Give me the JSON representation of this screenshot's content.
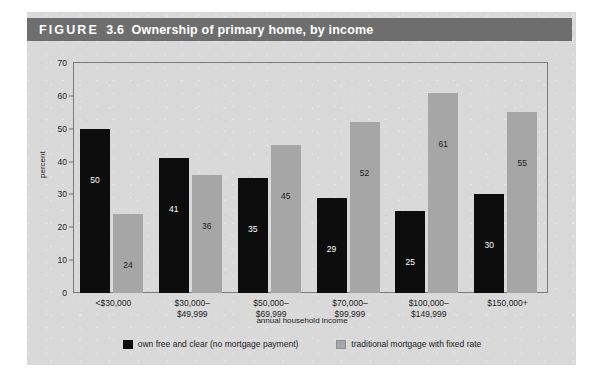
{
  "figure": {
    "label": "FIGURE",
    "number": "3.6",
    "title": "Ownership of primary home, by income"
  },
  "colors": {
    "header_bar": "#6e6e6e",
    "panel_background": "#d9d9d9",
    "series_own_free_and_clear": "#0d0d0d",
    "series_traditional_mortgage": "#a6a6a6",
    "axis": "#7a7a7a"
  },
  "chart_data": {
    "type": "bar",
    "title": "Ownership of primary home, by income",
    "xlabel": "annual household income",
    "ylabel": "percent",
    "ylim": [
      0,
      70
    ],
    "yticks": [
      0,
      10,
      20,
      30,
      40,
      50,
      60,
      70
    ],
    "grid": false,
    "legend_position": "bottom",
    "categories": [
      "<$30,000",
      "$30,000–\n$49,999",
      "$50,000–\n$69,999",
      "$70,000–\n$99,999",
      "$100,000–\n$149,999",
      "$150,000+"
    ],
    "series": [
      {
        "name": "own free and clear (no mortgage payment)",
        "color": "#0d0d0d",
        "values": [
          50,
          41,
          35,
          29,
          25,
          30
        ]
      },
      {
        "name": "traditional mortgage with fixed rate",
        "color": "#a6a6a6",
        "values": [
          24,
          36,
          45,
          52,
          61,
          55
        ]
      }
    ]
  }
}
